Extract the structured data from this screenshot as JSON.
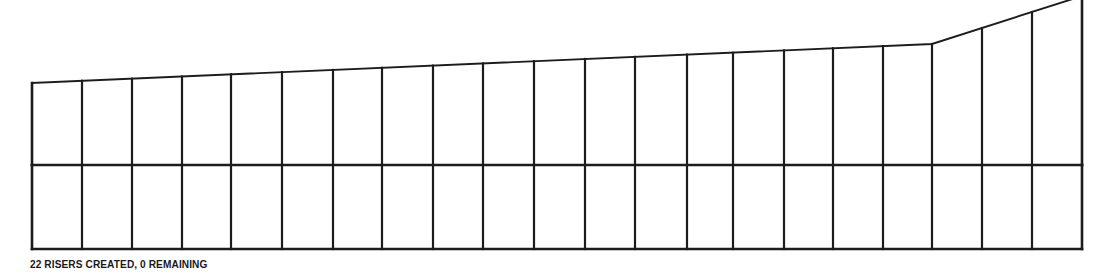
{
  "app": {
    "view_name": "stair-riser-elevation"
  },
  "status": {
    "message": "22 RISERS CREATED, 0 REMAINING",
    "risers_created": 22,
    "risers_remaining": 0
  },
  "drawing": {
    "name": "riser-elevation-drawing",
    "stroke_color": "#1c1c1c",
    "background_color": "#ffffff",
    "outer_stroke_width": 2.6,
    "inner_stroke_width": 2.2,
    "top_profile_stroke_width": 1.9,
    "bounds": {
      "left": 32,
      "right": 1082,
      "bottom": 249,
      "mid_rail_y": 165
    },
    "top_profile": [
      {
        "x": 32,
        "y": 83
      },
      {
        "x": 932,
        "y": 44
      },
      {
        "x": 1082,
        "y": -4
      }
    ],
    "risers_x": [
      32,
      82,
      132,
      182,
      231,
      282,
      333,
      382,
      433,
      483,
      534,
      585,
      635,
      687,
      733,
      784,
      833,
      883,
      932,
      982,
      1032,
      1082
    ],
    "top_y_at_riser": [
      83,
      80.8,
      78.7,
      76.5,
      74.3,
      72.1,
      69.9,
      67.8,
      65.6,
      63.4,
      61.2,
      59.0,
      56.9,
      54.6,
      52.7,
      50.4,
      48.3,
      46.1,
      44,
      28,
      12,
      -4
    ],
    "riser_count": 22,
    "bay_count": 21
  }
}
